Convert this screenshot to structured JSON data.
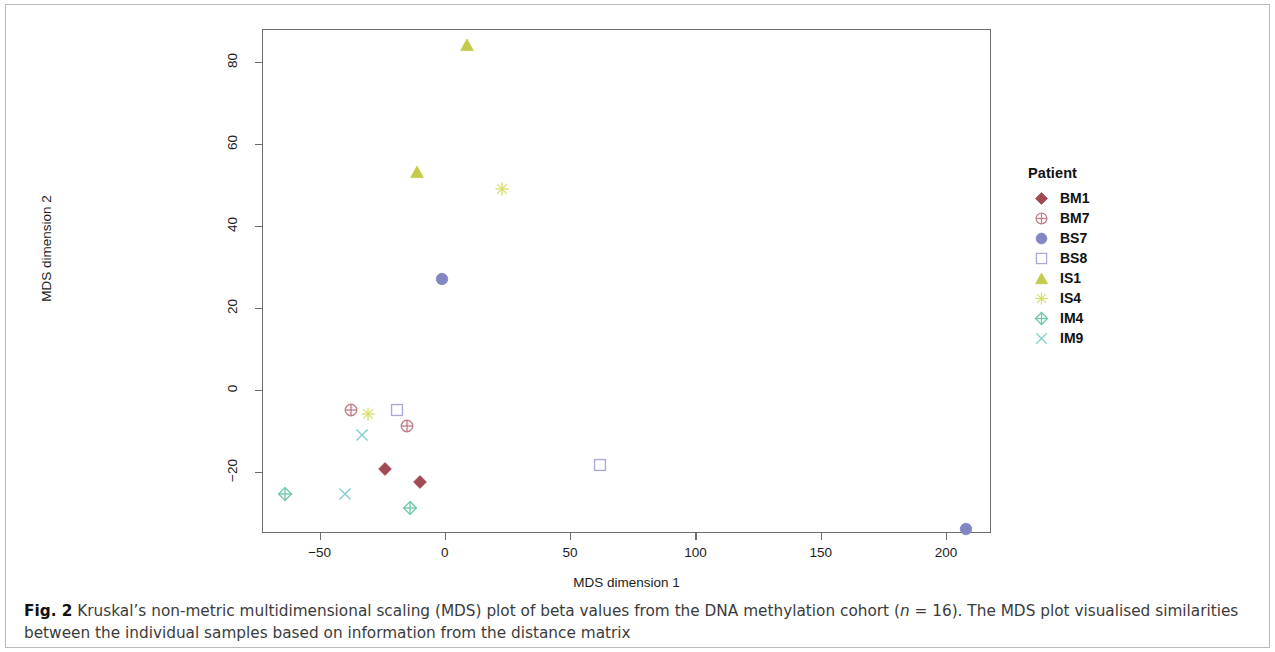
{
  "figure": {
    "caption_prefix": "Fig. 2",
    "caption_text_1": " Kruskal’s non-metric multidimensional scaling (MDS) plot of beta values from the DNA methylation cohort (",
    "caption_italic_n": "n",
    "caption_text_2": " = 16). The MDS plot visualised similarities between the individual samples based on information from the distance matrix"
  },
  "legend": {
    "title": "Patient",
    "items": [
      {
        "label": "BM1",
        "icon": "filled-diamond-icon",
        "shape": "diamond-filled",
        "color": "#a04a52"
      },
      {
        "label": "BM7",
        "icon": "circle-plus-icon",
        "shape": "circle-plus",
        "color": "#c07e86"
      },
      {
        "label": "BS7",
        "icon": "filled-circle-icon",
        "shape": "circle-filled",
        "color": "#8287c4"
      },
      {
        "label": "BS8",
        "icon": "open-square-icon",
        "shape": "square-open",
        "color": "#a8a9da"
      },
      {
        "label": "IS1",
        "icon": "filled-triangle-icon",
        "shape": "triangle-filled",
        "color": "#c3cc4a"
      },
      {
        "label": "IS4",
        "icon": "asterisk-icon",
        "shape": "asterisk",
        "color": "#d7df6b"
      },
      {
        "label": "IM4",
        "icon": "diamond-plus-icon",
        "shape": "diamond-plus",
        "color": "#6fc8a8"
      },
      {
        "label": "IM9",
        "icon": "cross-icon",
        "shape": "cross",
        "color": "#7ed0c9"
      }
    ]
  },
  "chart_data": {
    "type": "scatter",
    "title": "",
    "xlabel": "MDS dimension 1",
    "ylabel": "MDS dimension 2",
    "xlim": [
      -73,
      218
    ],
    "ylim": [
      -35,
      88
    ],
    "xticks": [
      -50,
      0,
      50,
      100,
      150,
      200
    ],
    "yticks": [
      -20,
      0,
      20,
      40,
      60,
      80
    ],
    "grid": false,
    "legend_position": "right",
    "n_samples": 16,
    "series": [
      {
        "name": "BM1",
        "shape": "diamond-filled",
        "color": "#a04a52",
        "points": [
          {
            "x": -24,
            "y": -19.5
          },
          {
            "x": -10,
            "y": -22.5
          }
        ]
      },
      {
        "name": "BM7",
        "shape": "circle-plus",
        "color": "#c07e86",
        "points": [
          {
            "x": -37.5,
            "y": -5.0
          },
          {
            "x": -15,
            "y": -9.0
          }
        ]
      },
      {
        "name": "BS7",
        "shape": "circle-filled",
        "color": "#8287c4",
        "points": [
          {
            "x": -1,
            "y": 27.0
          },
          {
            "x": 208,
            "y": -34.0
          }
        ]
      },
      {
        "name": "BS8",
        "shape": "square-open",
        "color": "#a8a9da",
        "points": [
          {
            "x": -19,
            "y": -5.0
          },
          {
            "x": 62,
            "y": -18.5
          }
        ]
      },
      {
        "name": "IS1",
        "shape": "triangle-filled",
        "color": "#c3cc4a",
        "points": [
          {
            "x": 9,
            "y": 84.0
          },
          {
            "x": -11,
            "y": 53.0
          }
        ]
      },
      {
        "name": "IS4",
        "shape": "asterisk",
        "color": "#d7df6b",
        "points": [
          {
            "x": -30.5,
            "y": -6.0
          },
          {
            "x": 23,
            "y": 49.0
          }
        ]
      },
      {
        "name": "IM4",
        "shape": "diamond-plus",
        "color": "#6fc8a8",
        "points": [
          {
            "x": -64,
            "y": -25.5
          },
          {
            "x": -14,
            "y": -29.0
          }
        ]
      },
      {
        "name": "IM9",
        "shape": "cross",
        "color": "#7ed0c9",
        "points": [
          {
            "x": -33,
            "y": -11.0
          },
          {
            "x": -40,
            "y": -25.5
          }
        ]
      }
    ]
  }
}
